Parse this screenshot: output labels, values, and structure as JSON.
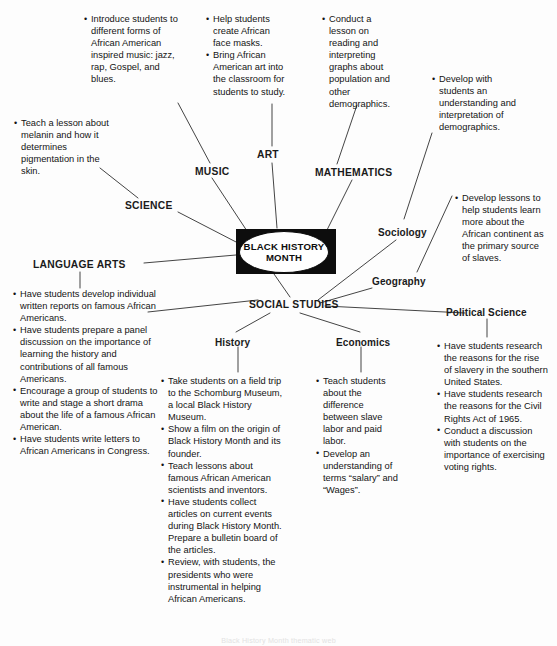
{
  "diagram": {
    "title": "Black History Month Thematic Web",
    "center": {
      "line1": "BLACK HISTORY",
      "line2": "MONTH"
    },
    "nodes": {
      "science": "SCIENCE",
      "music": "MUSIC",
      "art": "ART",
      "mathematics": "MATHEMATICS",
      "language_arts": "LANGUAGE ARTS",
      "social_studies": "SOCIAL STUDIES",
      "sociology": "Sociology",
      "geography": "Geography",
      "political_science": "Political Science",
      "history": "History",
      "economics": "Economics"
    },
    "notes": {
      "music": [
        "Introduce students to different forms of African American inspired music: jazz, rap, Gospel, and blues."
      ],
      "art": [
        "Help students create African face masks.",
        "Bring African American art into the classroom for students to study."
      ],
      "mathematics": [
        "Conduct a lesson on reading and interpreting graphs about population and other demographics."
      ],
      "sociology": [
        "Develop with students an understanding and interpretation of demographics."
      ],
      "science": [
        "Teach a lesson about melanin and how it determines pigmentation in the skin."
      ],
      "geography": [
        "Develop lessons to help students learn more about the African continent as the primary source of slaves."
      ],
      "language_arts": [
        "Have students develop individual written reports on famous African Americans.",
        "Have students prepare a panel discussion on the importance of learning the history and contributions of all famous Americans.",
        "Encourage a group of students to write and stage a short drama about the life of a famous African American.",
        "Have students write letters to African Americans in Congress."
      ],
      "history": [
        "Take students on a field trip to the Schomburg Museum, a local Black History Museum.",
        "Show a film on the origin of Black History Month and its founder.",
        "Teach lessons about famous African American scientists and inventors.",
        "Have students collect articles on current events during Black History Month. Prepare a bulletin board of the articles.",
        "Review, with students, the presidents who were instrumental in helping African Americans."
      ],
      "economics": [
        "Teach students about the difference between slave labor and paid labor.",
        "Develop an understanding of terms “salary” and “Wages”."
      ],
      "political_science": [
        "Have students research the reasons for the rise of slavery in the southern United States.",
        "Have students research the reasons for the Civil Rights Act of 1965.",
        "Conduct a discussion with students on the importance of exercising voting rights."
      ]
    },
    "footer_caption": "Black History Month thematic web"
  },
  "colors": {
    "ink": "#141414",
    "center_fill": "#0d0d0d",
    "page_background": "#fdfdfd",
    "line": "#3a3a3a"
  }
}
